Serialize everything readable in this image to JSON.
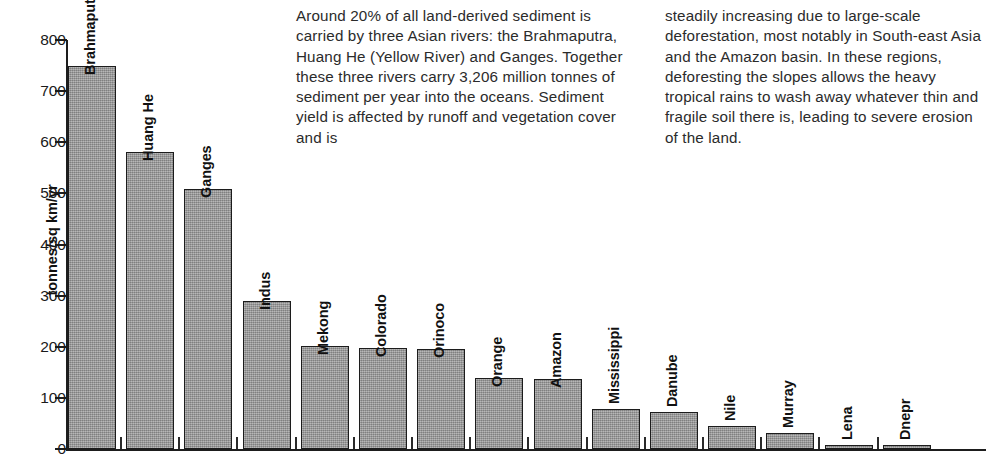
{
  "chart_data": {
    "type": "bar",
    "title": "",
    "xlabel": "",
    "ylabel": "tonnes/sq km/yr",
    "ylim": [
      0,
      800
    ],
    "ytick_labels": [
      "800",
      "700",
      "600",
      "500",
      "400",
      "300",
      "200",
      "100",
      "0"
    ],
    "yticks": [
      800,
      700,
      600,
      500,
      400,
      300,
      200,
      100,
      0
    ],
    "grid": false,
    "legend": null,
    "categories": [
      "Brahmaputra",
      "Huang He",
      "Ganges",
      "Indus",
      "Mekong",
      "Colorado",
      "Orinoco",
      "Orange",
      "Amazon",
      "Mississippi",
      "Danube",
      "Nile",
      "Murray",
      "Lena",
      "Dnepr"
    ],
    "values": [
      750,
      580,
      508,
      290,
      202,
      198,
      196,
      138,
      136,
      79,
      72,
      45,
      31,
      6,
      3
    ],
    "bar_color": "#9c9c9c",
    "bar_edge_color": "#1c1c1c"
  },
  "body_text": {
    "column_1": "Around 20% of all land-derived sediment is carried by three Asian rivers: the Brahmaputra, Huang He (Yellow River) and Ganges. Together these three rivers carry 3,206 million tonnes of sediment per year into the oceans. Sediment yield is affected by runoff and vegetation cover and is",
    "column_2": "steadily increasing due to large-scale deforestation, most notably in South-east Asia and the Amazon basin. In these regions, deforesting the slopes allows the heavy tropical rains to wash away whatever thin and fragile soil there is, leading to severe erosion of the land."
  }
}
